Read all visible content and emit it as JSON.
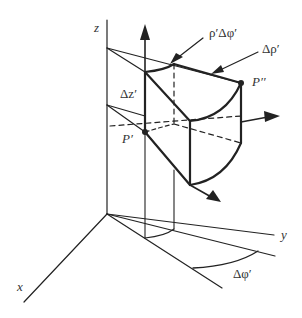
{
  "diagram": {
    "colors": {
      "stroke": "#222222",
      "text": "#333333",
      "background": "#ffffff"
    },
    "axes": {
      "z": {
        "label": "z"
      },
      "x": {
        "label": "x"
      },
      "y": {
        "label": "y"
      }
    },
    "labels": {
      "rho_dphi": "ρ′Δφ′",
      "drho": "Δρ′",
      "dz": "Δz′",
      "p_prime": "P′",
      "p_double_prime": "P′′",
      "dphi": "Δφ′"
    },
    "elements": [
      "z-axis",
      "x-axis",
      "y-axis",
      "volume-element",
      "unit-vector-z",
      "unit-vector-rho",
      "unit-vector-phi",
      "angle-arc-dphi",
      "point-p-prime",
      "point-p-double-prime"
    ]
  }
}
